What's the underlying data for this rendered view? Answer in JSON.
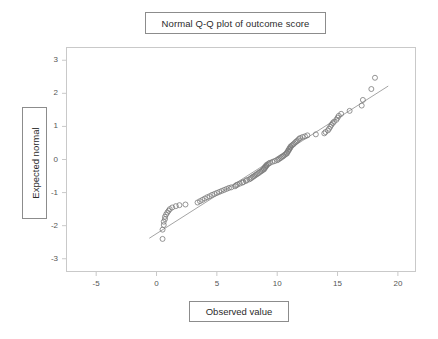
{
  "chart_data": {
    "type": "scatter",
    "title": "Normal Q-Q plot of outcome score",
    "xlabel": "Observed value",
    "ylabel": "Expected normal",
    "xlim": [
      -7.5,
      21.5
    ],
    "ylim": [
      -3.4,
      3.4
    ],
    "xticks": [
      -5,
      0,
      5,
      10,
      15,
      20
    ],
    "yticks": [
      3,
      2,
      1,
      0,
      -1,
      -2,
      -3
    ],
    "xtick_labels": [
      "-5",
      "0",
      "5",
      "10",
      "15",
      "20"
    ],
    "ytick_labels": [
      "3",
      "2",
      "1",
      "0",
      "-1",
      "-2",
      "-3"
    ],
    "grid": false,
    "legend": "none",
    "marker": "open-circle",
    "marker_color": "#7a7a7a",
    "line_color": "#9a9a9a",
    "frame_color": "#c9c9c9",
    "reference_line": {
      "x_start": -0.6,
      "y_start": -2.38,
      "x_end": 19.2,
      "y_end": 2.22
    },
    "points": [
      [
        0.5,
        -2.4
      ],
      [
        0.5,
        -2.12
      ],
      [
        0.6,
        -1.98
      ],
      [
        0.6,
        -1.88
      ],
      [
        0.7,
        -1.8
      ],
      [
        0.7,
        -1.73
      ],
      [
        0.8,
        -1.66
      ],
      [
        0.9,
        -1.6
      ],
      [
        1.0,
        -1.55
      ],
      [
        1.1,
        -1.5
      ],
      [
        1.3,
        -1.45
      ],
      [
        1.6,
        -1.41
      ],
      [
        1.9,
        -1.38
      ],
      [
        2.4,
        -1.36
      ],
      [
        3.4,
        -1.3
      ],
      [
        3.6,
        -1.26
      ],
      [
        3.8,
        -1.22
      ],
      [
        4.0,
        -1.18
      ],
      [
        4.2,
        -1.14
      ],
      [
        4.4,
        -1.11
      ],
      [
        4.6,
        -1.07
      ],
      [
        4.8,
        -1.04
      ],
      [
        5.0,
        -1.01
      ],
      [
        5.2,
        -0.98
      ],
      [
        5.4,
        -0.95
      ],
      [
        5.6,
        -0.92
      ],
      [
        5.8,
        -0.89
      ],
      [
        6.0,
        -0.86
      ],
      [
        6.2,
        -0.84
      ],
      [
        6.5,
        -0.81
      ],
      [
        6.6,
        -0.78
      ],
      [
        6.7,
        -0.76
      ],
      [
        6.9,
        -0.73
      ],
      [
        7.1,
        -0.7
      ],
      [
        7.2,
        -0.68
      ],
      [
        7.4,
        -0.65
      ],
      [
        7.5,
        -0.62
      ],
      [
        7.7,
        -0.6
      ],
      [
        7.8,
        -0.57
      ],
      [
        7.9,
        -0.55
      ],
      [
        8.0,
        -0.52
      ],
      [
        8.1,
        -0.5
      ],
      [
        8.2,
        -0.47
      ],
      [
        8.3,
        -0.45
      ],
      [
        8.4,
        -0.42
      ],
      [
        8.5,
        -0.4
      ],
      [
        8.6,
        -0.37
      ],
      [
        8.7,
        -0.35
      ],
      [
        8.8,
        -0.32
      ],
      [
        8.9,
        -0.3
      ],
      [
        8.9,
        -0.27
      ],
      [
        9.0,
        -0.25
      ],
      [
        9.0,
        -0.22
      ],
      [
        9.1,
        -0.2
      ],
      [
        9.1,
        -0.17
      ],
      [
        9.2,
        -0.15
      ],
      [
        9.3,
        -0.12
      ],
      [
        9.4,
        -0.1
      ],
      [
        9.6,
        -0.07
      ],
      [
        9.8,
        -0.05
      ],
      [
        10.0,
        -0.02
      ],
      [
        10.1,
        0.0
      ],
      [
        10.2,
        0.03
      ],
      [
        10.3,
        0.05
      ],
      [
        10.4,
        0.08
      ],
      [
        10.5,
        0.1
      ],
      [
        10.6,
        0.13
      ],
      [
        10.7,
        0.16
      ],
      [
        10.8,
        0.18
      ],
      [
        10.8,
        0.21
      ],
      [
        10.9,
        0.24
      ],
      [
        10.9,
        0.27
      ],
      [
        11.0,
        0.3
      ],
      [
        11.0,
        0.33
      ],
      [
        11.1,
        0.36
      ],
      [
        11.1,
        0.39
      ],
      [
        11.2,
        0.42
      ],
      [
        11.3,
        0.45
      ],
      [
        11.4,
        0.48
      ],
      [
        11.5,
        0.52
      ],
      [
        11.6,
        0.55
      ],
      [
        11.7,
        0.58
      ],
      [
        11.8,
        0.62
      ],
      [
        11.9,
        0.65
      ],
      [
        12.1,
        0.68
      ],
      [
        12.3,
        0.7
      ],
      [
        12.5,
        0.73
      ],
      [
        13.2,
        0.76
      ],
      [
        13.9,
        0.79
      ],
      [
        14.0,
        0.83
      ],
      [
        14.2,
        0.88
      ],
      [
        14.3,
        0.93
      ],
      [
        14.4,
        0.99
      ],
      [
        14.5,
        1.05
      ],
      [
        14.6,
        1.1
      ],
      [
        14.7,
        1.14
      ],
      [
        14.9,
        1.2
      ],
      [
        15.0,
        1.26
      ],
      [
        15.1,
        1.32
      ],
      [
        15.3,
        1.38
      ],
      [
        16.0,
        1.47
      ],
      [
        17.0,
        1.63
      ],
      [
        17.1,
        1.8
      ],
      [
        17.8,
        2.13
      ],
      [
        18.1,
        2.47
      ]
    ]
  }
}
